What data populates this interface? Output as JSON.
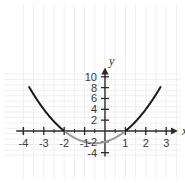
{
  "chart_data": {
    "type": "line",
    "title": "",
    "subtitle": "",
    "xlabel": "x",
    "ylabel": "y",
    "xlim": [
      -4.3,
      3.4
    ],
    "ylim": [
      -4.6,
      10.6
    ],
    "grid": true,
    "legend": null,
    "x_ticks": [
      -4,
      -3,
      -2,
      -1,
      1,
      2,
      3
    ],
    "x_tick_labels": [
      "-4",
      "-3",
      "-2",
      "-1",
      "1",
      "2",
      "3"
    ],
    "x_minor_ticks": [
      -3.5,
      -2.5,
      -1.5,
      -0.5,
      0.5,
      1.5,
      2.5
    ],
    "y_ticks": [
      10,
      8,
      6,
      4,
      2,
      -2,
      -4
    ],
    "y_tick_labels": [
      "10",
      "8",
      "6",
      "4",
      "2",
      "-2",
      "-4"
    ],
    "series": [
      {
        "name": "y = x^2 + x - 2",
        "equation": "y = x^2 + x - 2",
        "color_above_axis": "#1a1a1a",
        "color_below_axis": "#9a9a9a",
        "line_width": 2,
        "x_start": -3.72,
        "x_end": 2.72,
        "roots": [
          -2,
          1
        ],
        "vertex": [
          -0.5,
          -2.25
        ],
        "y_intercept": -2,
        "points": [
          {
            "x": -3.72,
            "y": 10.12
          },
          {
            "x": -3.5,
            "y": 6.75
          },
          {
            "x": -3.0,
            "y": 4.0
          },
          {
            "x": -2.5,
            "y": 1.75
          },
          {
            "x": -2.0,
            "y": 0.0
          },
          {
            "x": -1.5,
            "y": -1.25
          },
          {
            "x": -1.0,
            "y": -2.0
          },
          {
            "x": -0.5,
            "y": -2.25
          },
          {
            "x": 0.0,
            "y": -2.0
          },
          {
            "x": 0.5,
            "y": -1.25
          },
          {
            "x": 1.0,
            "y": 0.0
          },
          {
            "x": 1.5,
            "y": 1.75
          },
          {
            "x": 2.0,
            "y": 4.0
          },
          {
            "x": 2.5,
            "y": 6.75
          },
          {
            "x": 2.72,
            "y": 8.12
          }
        ]
      }
    ],
    "axis_color": "#2b2b2b",
    "grid_color": "#efeef2",
    "background": "#ffffff"
  },
  "axes": {
    "x_axis_label": "x",
    "y_axis_label": "y"
  }
}
